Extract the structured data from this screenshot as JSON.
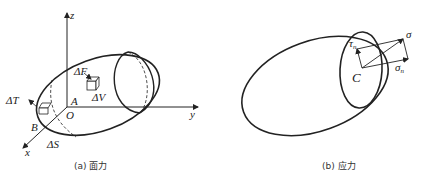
{
  "figure_a": {
    "caption": "(a) 面力",
    "axes": {
      "x": "x",
      "y": "y",
      "z": "z",
      "origin": "O"
    },
    "labels": {
      "dF": "ΔF",
      "dV": "ΔV",
      "dT": "ΔT",
      "dS": "ΔS",
      "A": "A",
      "B": "B"
    }
  },
  "figure_b": {
    "caption": "(b) 应力",
    "labels": {
      "tau": "τ",
      "tau_sub": "n",
      "sigma": "σ",
      "sigma_n": "σ",
      "sigma_n_sub": "n",
      "C": "C"
    }
  },
  "colors": {
    "stroke": "#222222",
    "background": "#ffffff"
  }
}
